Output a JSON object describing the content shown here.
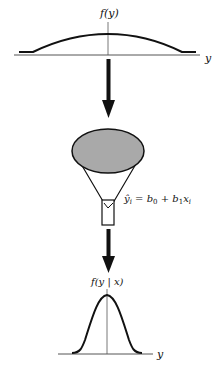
{
  "diagram": {
    "top_plot": {
      "ylabel": "f(y)",
      "xlabel": "y",
      "shape": "wide flat distribution"
    },
    "funnel": {
      "equation": "ŷ_i = b_0 + b_1 x_i",
      "equation_parts": {
        "lhs": "ŷ",
        "lhs_sub": "i",
        "eq": " = ",
        "b0": "b",
        "b0_sub": "0",
        "plus": " + ",
        "b1": "b",
        "b1_sub": "1",
        "x": "x",
        "x_sub": "i"
      },
      "fill_color": "#a9a9a9"
    },
    "bottom_plot": {
      "ylabel": "f(y | x)",
      "xlabel": "y",
      "shape": "narrow normal distribution"
    },
    "colors": {
      "stroke": "#111111",
      "axis": "#555555"
    }
  }
}
